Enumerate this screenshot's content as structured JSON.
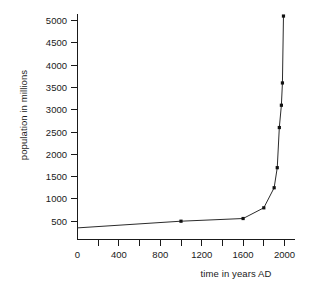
{
  "chart_data": {
    "type": "line",
    "title": "",
    "xlabel": "time in years AD",
    "ylabel": "population in millions",
    "xlim": [
      0,
      2060
    ],
    "ylim": [
      0,
      5250
    ],
    "grid": false,
    "legend": null,
    "x_major_ticks": [
      0,
      400,
      800,
      1200,
      1600,
      2000
    ],
    "x_major_tick_labels": [
      "0",
      "400",
      "800",
      "1200",
      "1600",
      "2000"
    ],
    "x_minor_ticks": [
      200,
      600,
      1000,
      1400,
      1800
    ],
    "y_major_ticks": [
      500,
      1000,
      1500,
      2000,
      2500,
      3000,
      3500,
      4000,
      4500,
      5000
    ],
    "y_major_tick_labels": [
      "500",
      "1000",
      "1500",
      "2000",
      "2500",
      "3000",
      "3500",
      "4000",
      "4500",
      "5000"
    ],
    "series": [
      {
        "name": "world population",
        "marker": "square",
        "x": [
          0,
          1000,
          1600,
          1800,
          1900,
          1930,
          1950,
          1970,
          1980,
          1990
        ],
        "values": [
          350,
          500,
          560,
          800,
          1250,
          1700,
          2600,
          3100,
          3600,
          5100
        ]
      }
    ]
  },
  "axis": {
    "x_label": "time in years AD",
    "y_label": "population in millions",
    "x_ticks": [
      "0",
      "400",
      "800",
      "1200",
      "1600",
      "2000"
    ],
    "y_ticks": [
      "5000",
      "4500",
      "4000",
      "3500",
      "3000",
      "2500",
      "2000",
      "1500",
      "1000",
      "500"
    ]
  },
  "colors": {
    "curve": "#2b2b2b",
    "marker": "#111111",
    "axis": "#1a1a1a",
    "background": "#ffffff"
  }
}
